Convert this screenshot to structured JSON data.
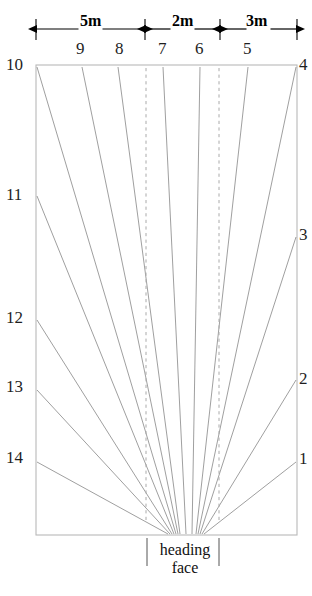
{
  "figure": {
    "kind": "borehole-fan-layout-plan",
    "heading_face_label_line1": "heading",
    "heading_face_label_line2": "face",
    "colors": {
      "rect_stroke": "#b9b9b9",
      "ray_stroke": "#8e8e8e",
      "dash_stroke": "#aaaaaa",
      "dim_stroke": "#000000",
      "text": "#1a1a1a",
      "background": "#ffffff"
    }
  },
  "dimensions": {
    "segments": [
      {
        "label": "5m",
        "x_from": 36,
        "x_to": 145,
        "text_x": 80,
        "text_y": 12
      },
      {
        "label": "2m",
        "x_from": 145,
        "x_to": 220,
        "text_x": 172,
        "text_y": 12
      },
      {
        "label": "3m",
        "x_from": 220,
        "x_to": 297,
        "text_x": 246,
        "text_y": 12
      }
    ],
    "line_y": 29,
    "tick_x": [
      36,
      145,
      220,
      297
    ],
    "tick_top": 19,
    "tick_bottom": 40
  },
  "rect": {
    "left": 36,
    "top": 65,
    "right": 297,
    "bottom": 535
  },
  "dashed_lines": [
    {
      "x": 146,
      "y_from": 68,
      "y_to": 520
    },
    {
      "x": 219,
      "y_from": 68,
      "y_to": 520
    }
  ],
  "top_labels": [
    {
      "text": "9",
      "x": 76,
      "y": 40
    },
    {
      "text": "8",
      "x": 115,
      "y": 40
    },
    {
      "text": "7",
      "x": 158,
      "y": 40
    },
    {
      "text": "6",
      "x": 195,
      "y": 40
    },
    {
      "text": "5",
      "x": 243,
      "y": 40
    }
  ],
  "left_labels": [
    {
      "text": "10",
      "x": 6,
      "y": 56
    },
    {
      "text": "11",
      "x": 6,
      "y": 186
    },
    {
      "text": "12",
      "x": 6,
      "y": 309
    },
    {
      "text": "13",
      "x": 6,
      "y": 378
    },
    {
      "text": "14",
      "x": 6,
      "y": 449
    }
  ],
  "right_labels": [
    {
      "text": "4",
      "x": 299,
      "y": 56
    },
    {
      "text": "3",
      "x": 299,
      "y": 226
    },
    {
      "text": "2",
      "x": 299,
      "y": 370
    },
    {
      "text": "1",
      "x": 299,
      "y": 450
    }
  ],
  "heading_face": {
    "text_x": 185,
    "text_y": 541,
    "tick_left_x": 147,
    "tick_right_x": 219,
    "tick_top": 538,
    "tick_bottom": 566
  },
  "rays": [
    {
      "id": "14",
      "x1": 37,
      "y1": 462,
      "x2": 168,
      "y2": 534
    },
    {
      "id": "13",
      "x1": 37,
      "y1": 390,
      "x2": 170,
      "y2": 534
    },
    {
      "id": "12",
      "x1": 37,
      "y1": 320,
      "x2": 172,
      "y2": 534
    },
    {
      "id": "11",
      "x1": 37,
      "y1": 196,
      "x2": 174,
      "y2": 534
    },
    {
      "id": "10",
      "x1": 37,
      "y1": 67,
      "x2": 176,
      "y2": 534
    },
    {
      "id": "9",
      "x1": 82,
      "y1": 67,
      "x2": 178,
      "y2": 534
    },
    {
      "id": "8",
      "x1": 118,
      "y1": 67,
      "x2": 180,
      "y2": 534
    },
    {
      "id": "7",
      "x1": 163,
      "y1": 67,
      "x2": 186,
      "y2": 534
    },
    {
      "id": "6",
      "x1": 200,
      "y1": 67,
      "x2": 192,
      "y2": 534
    },
    {
      "id": "5",
      "x1": 248,
      "y1": 67,
      "x2": 196,
      "y2": 534
    },
    {
      "id": "4",
      "x1": 296,
      "y1": 67,
      "x2": 198,
      "y2": 534
    },
    {
      "id": "3",
      "x1": 296,
      "y1": 237,
      "x2": 200,
      "y2": 534
    },
    {
      "id": "2",
      "x1": 296,
      "y1": 380,
      "x2": 202,
      "y2": 534
    },
    {
      "id": "1",
      "x1": 296,
      "y1": 462,
      "x2": 204,
      "y2": 534
    }
  ]
}
